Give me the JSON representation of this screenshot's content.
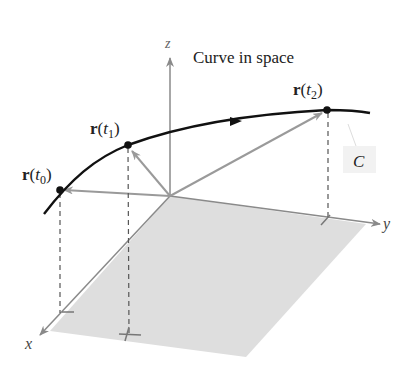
{
  "title": "Curve in space",
  "axes": {
    "x_label": "x",
    "y_label": "y",
    "z_label": "z"
  },
  "curve_label": "C",
  "points": [
    {
      "label_bold": "r",
      "label_open": "(",
      "label_var": "t",
      "label_sub": "0",
      "label_close": ")"
    },
    {
      "label_bold": "r",
      "label_open": "(",
      "label_var": "t",
      "label_sub": "1",
      "label_close": ")"
    },
    {
      "label_bold": "r",
      "label_open": "(",
      "label_var": "t",
      "label_sub": "2",
      "label_close": ")"
    }
  ],
  "colors": {
    "curve": "#111111",
    "axis": "#8a8a8a",
    "vector": "#9a9a9a",
    "plane": "#dedede",
    "dashed": "#555555",
    "label_box": "#f2f2f2"
  }
}
